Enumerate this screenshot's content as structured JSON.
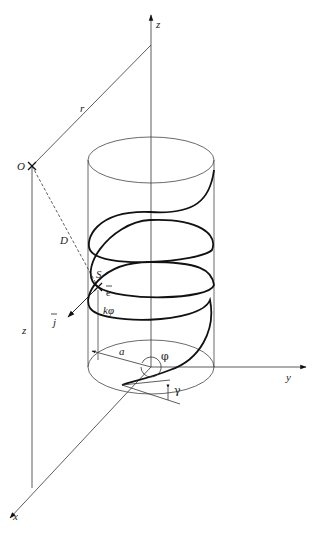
{
  "diagram": {
    "type": "3d-helix-geometry",
    "labels": {
      "z_axis": "z",
      "y_axis": "y",
      "x_axis": "x",
      "point_O": "O",
      "point_S": "S",
      "distance_r": "r",
      "distance_D": "D",
      "height_z": "z",
      "unit_vector_e": "e",
      "unit_vector_j": "j",
      "pitch": "kφ",
      "radius": "a",
      "angle_phi": "φ",
      "angle_gamma": "γ"
    },
    "colors": {
      "line": "#333333",
      "helix": "#111111",
      "background": "#ffffff"
    }
  }
}
